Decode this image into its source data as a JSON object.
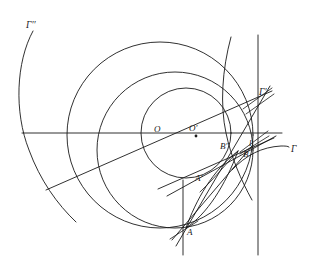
{
  "figure": {
    "background_color": "#ffffff",
    "stroke_color": "#1a1a1a",
    "width": 312,
    "height": 271
  },
  "labels": {
    "gamma_double_prime": "Γ′′",
    "gamma_prime": "Γ′",
    "gamma": "Γ",
    "center_O": "O",
    "center_O_prime": "O′",
    "point_A": "A",
    "point_A_prime": "A′",
    "point_B": "B",
    "point_B_prime": "B′",
    "line_l": "l"
  },
  "label_positions": {
    "gamma_double_prime": {
      "x": 26,
      "y": 24
    },
    "gamma_prime": {
      "x": 259,
      "y": 93
    },
    "gamma": {
      "x": 290,
      "y": 151
    },
    "center_O": {
      "x": 155,
      "y": 131
    },
    "center_O_prime": {
      "x": 190,
      "y": 130
    },
    "point_A": {
      "x": 188,
      "y": 233
    },
    "point_A_prime": {
      "x": 196,
      "y": 180
    },
    "point_B": {
      "x": 243,
      "y": 155
    },
    "point_B_prime": {
      "x": 222,
      "y": 147
    },
    "line_l": {
      "x": 250,
      "y": 144
    }
  },
  "circles": [
    {
      "name": "large-circle-O",
      "cx": 160,
      "cy": 135,
      "r": 93
    },
    {
      "name": "small-circle-O-prime",
      "cx": 186,
      "cy": 133,
      "r": 45
    },
    {
      "name": "circle-through-A-B",
      "cx": 192,
      "cy": 151,
      "r": 78
    }
  ],
  "arcs": [
    {
      "name": "arc-gamma-double-prime",
      "description": "left large arc labelled Gamma double prime"
    },
    {
      "name": "arc-gamma-prime",
      "description": "upper right arc labelled Gamma prime"
    },
    {
      "name": "arc-gamma",
      "description": "right arc labelled Gamma crossing horizontal axis"
    },
    {
      "name": "arc-lens-upper",
      "description": "arc of lens region from A to B"
    },
    {
      "name": "arc-lens-lower",
      "description": "second arc of lens region from A to B"
    }
  ],
  "lines": [
    {
      "name": "horizontal-axis",
      "x1": 22,
      "y1": 133,
      "x2": 282,
      "y2": 133
    },
    {
      "name": "vertical-line-l",
      "x1": 258,
      "y1": 35,
      "x2": 258,
      "y2": 255
    },
    {
      "name": "secant-O-to-gamma-prime",
      "x1": 48,
      "y1": 188,
      "x2": 272,
      "y2": 91
    },
    {
      "name": "secant-A-to-gamma-prime",
      "x1": 176,
      "y1": 244,
      "x2": 270,
      "y2": 86
    },
    {
      "name": "secant-A-prime-to-B",
      "x1": 166,
      "y1": 194,
      "x2": 275,
      "y2": 135
    },
    {
      "name": "secant-through-A-prime",
      "x1": 160,
      "y1": 186,
      "x2": 272,
      "y2": 136
    },
    {
      "name": "short-tick-near-A",
      "x1": 171,
      "y1": 238,
      "x2": 200,
      "y2": 219
    }
  ],
  "points": [
    {
      "name": "point-O-prime-dot",
      "cx": 196,
      "cy": 136
    }
  ]
}
